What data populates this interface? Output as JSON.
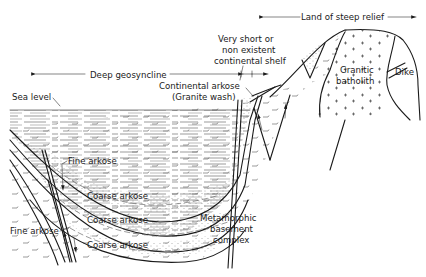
{
  "diagram": {
    "type": "geologic cross-section",
    "colors": {
      "ink": "#1a1a1a",
      "background": "#ffffff"
    },
    "labels": {
      "land_of_steep_relief": "Land of steep relief",
      "deep_geosyncline": "Deep geosyncline",
      "shelf_line1": "Very short or",
      "shelf_line2": "non existent",
      "shelf_line3": "continental shelf",
      "sea_level": "Sea level",
      "continental_arkose_line1": "Continental arkose",
      "continental_arkose_line2": "(Granite wash)",
      "granitic_line1": "Granitic",
      "granitic_line2": "batholith",
      "dike": "Dike",
      "fine_arkose_upper": "Fine arkose",
      "coarse_arkose_1": "Coarse arkose",
      "coarse_arkose_2": "Coarse arkose",
      "coarse_arkose_3": "Coarse arkose",
      "fine_arkose_lower": "Fine arkose",
      "metamorphic_line1": "Metamorphic",
      "metamorphic_line2": "basement",
      "metamorphic_line3": "complex"
    }
  }
}
